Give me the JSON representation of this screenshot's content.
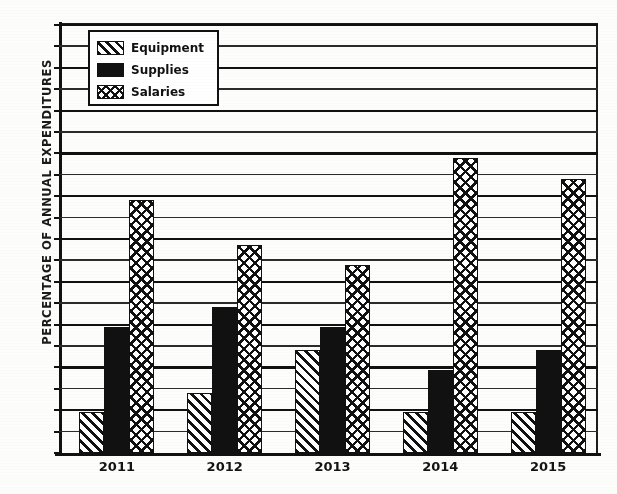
{
  "chart_data": {
    "type": "bar",
    "title": "",
    "xlabel": "",
    "ylabel": "PERCENTAGE OF ANNUAL EXPENDITURES",
    "categories": [
      "2011",
      "2012",
      "2013",
      "2014",
      "2015"
    ],
    "series": [
      {
        "name": "Equipment",
        "pattern": "diagonal-hatch",
        "color": "#111111",
        "values": [
          9.5,
          14,
          24,
          9.5,
          9.5
        ]
      },
      {
        "name": "Supplies",
        "pattern": "solid-black",
        "color": "#111111",
        "values": [
          29.5,
          34,
          29.5,
          19.5,
          24
        ]
      },
      {
        "name": "Salaries",
        "pattern": "cross-hatch",
        "color": "#111111",
        "values": [
          59,
          48.5,
          44,
          69,
          64
        ]
      }
    ],
    "ylim": [
      0,
      100
    ],
    "ytick_step": 5,
    "yticks": [
      0,
      5,
      10,
      15,
      20,
      25,
      30,
      35,
      40,
      45,
      50,
      55,
      60,
      65,
      70,
      75,
      80,
      85,
      90,
      95,
      100
    ],
    "grid": true,
    "grid_axis": "y",
    "legend_position": "top-left",
    "legend_entries": [
      "Equipment",
      "Supplies",
      "Salaries"
    ]
  }
}
